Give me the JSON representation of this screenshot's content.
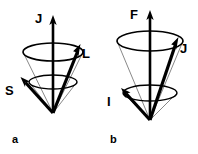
{
  "figure": {
    "background_color": "#ffffff",
    "ink_color": "#000000",
    "thin_line_color": "#333333"
  },
  "panels": [
    {
      "id": "a",
      "caption": "a",
      "caption_x": 12,
      "caption_y": 143,
      "apex": {
        "x": 53,
        "y": 113
      },
      "outer_cone": {
        "name": "outer-precession-cone",
        "cx": 53,
        "cy": 52,
        "rx": 30,
        "ry": 9
      },
      "inner_cone": {
        "name": "inner-precession-cone",
        "cx": 53,
        "cy": 82,
        "rx": 24,
        "ry": 7
      },
      "vectors": [
        {
          "name": "J",
          "label": "J",
          "role": "total-angular-momentum",
          "x1": 53,
          "y1": 113,
          "x2": 53,
          "y2": 17,
          "width": 2.6,
          "head_size": 5,
          "label_x": 35,
          "label_y": 23
        },
        {
          "name": "L",
          "label": "L",
          "role": "orbital-angular-momentum",
          "x1": 53,
          "y1": 113,
          "x2": 79,
          "y2": 47,
          "width": 3.2,
          "head_size": 5,
          "label_x": 82,
          "label_y": 58
        },
        {
          "name": "S",
          "label": "S",
          "role": "spin-angular-momentum",
          "x1": 53,
          "y1": 113,
          "x2": 22,
          "y2": 79,
          "width": 3.2,
          "head_size": 5,
          "label_x": 6,
          "label_y": 95
        }
      ]
    },
    {
      "id": "b",
      "caption": "b",
      "caption_x": 110,
      "caption_y": 143,
      "apex": {
        "x": 150,
        "y": 120
      },
      "outer_cone": {
        "name": "outer-precession-cone",
        "cx": 150,
        "cy": 41,
        "rx": 33,
        "ry": 10
      },
      "inner_cone": {
        "name": "inner-precession-cone",
        "cx": 150,
        "cy": 93,
        "rx": 27,
        "ry": 8
      },
      "vectors": [
        {
          "name": "F",
          "label": "F",
          "role": "total-atomic-angular-momentum",
          "x1": 150,
          "y1": 120,
          "x2": 150,
          "y2": 12,
          "width": 2.6,
          "head_size": 5,
          "label_x": 131,
          "label_y": 19
        },
        {
          "name": "J",
          "label": "J",
          "role": "electronic-angular-momentum",
          "x1": 150,
          "y1": 120,
          "x2": 177,
          "y2": 40,
          "width": 3.2,
          "head_size": 5,
          "label_x": 180,
          "label_y": 53
        },
        {
          "name": "I",
          "label": "I",
          "role": "nuclear-spin",
          "x1": 150,
          "y1": 120,
          "x2": 122,
          "y2": 90,
          "width": 3.2,
          "head_size": 5,
          "label_x": 108,
          "label_y": 106
        }
      ]
    }
  ]
}
